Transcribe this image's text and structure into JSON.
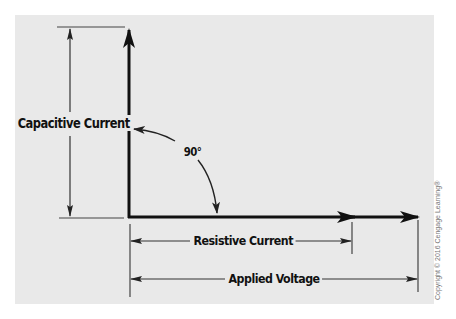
{
  "diagram": {
    "labels": {
      "capacitive_current": "Capacitive Current",
      "angle": "90°",
      "resistive_current": "Resistive Current",
      "applied_voltage": "Applied Voltage"
    },
    "copyright": "Copyright © 2016 Cengage Learning®",
    "colors": {
      "panel_background": "#e9e9e9",
      "page_background": "#ffffff",
      "stroke": "#111111",
      "copyright_text": "#777777"
    }
  }
}
